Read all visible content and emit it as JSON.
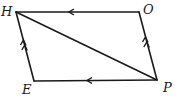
{
  "diagram": {
    "type": "parallelogram-vectors",
    "stroke_color": "#1a1a1a",
    "vertices": {
      "H": {
        "label": "H",
        "x": 16,
        "y": 12
      },
      "O": {
        "label": "O",
        "x": 139,
        "y": 12
      },
      "E": {
        "label": "E",
        "x": 34,
        "y": 81
      },
      "P": {
        "label": "P",
        "x": 157,
        "y": 80
      }
    },
    "edges": [
      {
        "from": "O",
        "to": "H",
        "arrows": 1
      },
      {
        "from": "P",
        "to": "E",
        "arrows": 1
      },
      {
        "from": "E",
        "to": "H",
        "arrows": 2
      },
      {
        "from": "P",
        "to": "O",
        "arrows": 2
      },
      {
        "from": "H",
        "to": "P",
        "arrows": 0
      }
    ]
  }
}
